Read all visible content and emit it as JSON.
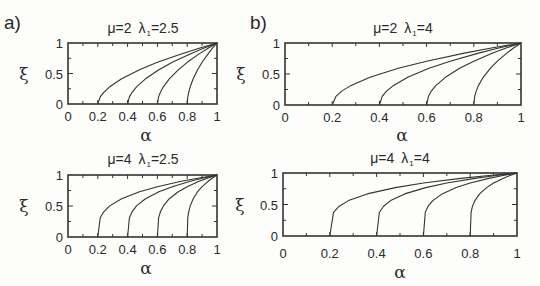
{
  "figure": {
    "panel_labels": [
      "a)",
      "b)"
    ]
  },
  "chart_data": [
    {
      "id": "a-top",
      "type": "line",
      "panel": "a)",
      "title": "μ=2  λ1=2.5",
      "mu": "2",
      "lambda1": "2.5",
      "xlabel": "α",
      "ylabel": "ξ",
      "xlim": [
        0,
        1
      ],
      "ylim": [
        0,
        1
      ],
      "xticks": [
        "0",
        "0.2",
        "0.4",
        "0.6",
        "0.8",
        "1"
      ],
      "yticks": [
        "0",
        "0.5",
        "1"
      ],
      "grid": false,
      "series": [
        {
          "name": "α0=0.2",
          "start": 0.2
        },
        {
          "name": "α0=0.4",
          "start": 0.4
        },
        {
          "name": "α0=0.6",
          "start": 0.6
        },
        {
          "name": "α0=0.8",
          "start": 0.8
        }
      ],
      "t": [
        0,
        0.02,
        0.05,
        0.1,
        0.2,
        0.35,
        0.5,
        0.7,
        0.85,
        1
      ],
      "xi": [
        0,
        0.116,
        0.192,
        0.282,
        0.413,
        0.561,
        0.683,
        0.822,
        0.915,
        1
      ]
    },
    {
      "id": "b-top",
      "type": "line",
      "panel": "b)",
      "title": "μ=2  λ1=4",
      "mu": "2",
      "lambda1": "4",
      "xlabel": "α",
      "ylabel": "ξ",
      "xlim": [
        0,
        1
      ],
      "ylim": [
        0,
        1
      ],
      "xticks": [
        "0",
        "0.2",
        "0.4",
        "0.6",
        "0.8",
        "1"
      ],
      "yticks": [
        "0",
        "0.5",
        "1"
      ],
      "grid": false,
      "series": [
        {
          "name": "α0=0.2",
          "start": 0.2
        },
        {
          "name": "α0=0.4",
          "start": 0.4
        },
        {
          "name": "α0=0.6",
          "start": 0.6
        },
        {
          "name": "α0=0.8",
          "start": 0.8
        }
      ],
      "t": [
        0,
        0.02,
        0.05,
        0.1,
        0.2,
        0.35,
        0.5,
        0.7,
        0.85,
        1
      ],
      "xi": [
        0,
        0.141,
        0.224,
        0.316,
        0.447,
        0.592,
        0.707,
        0.837,
        0.922,
        1
      ]
    },
    {
      "id": "a-bottom",
      "type": "line",
      "panel": "a)",
      "title": "μ=4  λ1=2.5",
      "mu": "4",
      "lambda1": "2.5",
      "xlabel": "α",
      "ylabel": "ξ",
      "xlim": [
        0,
        1
      ],
      "ylim": [
        0,
        1
      ],
      "xticks": [
        "0",
        "0.2",
        "0.4",
        "0.6",
        "0.8",
        "1"
      ],
      "yticks": [
        "0",
        "0.5",
        "1"
      ],
      "grid": false,
      "series": [
        {
          "name": "α0=0.2",
          "start": 0.2
        },
        {
          "name": "α0=0.4",
          "start": 0.4
        },
        {
          "name": "α0=0.6",
          "start": 0.6
        },
        {
          "name": "α0=0.8",
          "start": 0.8
        }
      ],
      "t": [
        0,
        0.02,
        0.05,
        0.1,
        0.2,
        0.35,
        0.5,
        0.7,
        0.85,
        1
      ],
      "xi": [
        0,
        0.309,
        0.407,
        0.501,
        0.617,
        0.73,
        0.812,
        0.899,
        0.952,
        1
      ]
    },
    {
      "id": "b-bottom",
      "type": "line",
      "panel": "b)",
      "title": "μ=4  λ1=4",
      "mu": "4",
      "lambda1": "4",
      "xlabel": "α",
      "ylabel": "ξ",
      "xlim": [
        0,
        1
      ],
      "ylim": [
        0,
        1
      ],
      "xticks": [
        "0",
        "0.2",
        "0.4",
        "0.6",
        "0.8",
        "1"
      ],
      "yticks": [
        "0",
        "0.5",
        "1"
      ],
      "grid": false,
      "series": [
        {
          "name": "α0=0.2",
          "start": 0.2
        },
        {
          "name": "α0=0.4",
          "start": 0.4
        },
        {
          "name": "α0=0.6",
          "start": 0.6
        },
        {
          "name": "α0=0.8",
          "start": 0.8
        }
      ],
      "t": [
        0,
        0.02,
        0.05,
        0.1,
        0.2,
        0.35,
        0.5,
        0.7,
        0.85,
        1
      ],
      "xi": [
        0,
        0.376,
        0.473,
        0.562,
        0.669,
        0.769,
        0.841,
        0.915,
        0.96,
        1
      ]
    }
  ]
}
